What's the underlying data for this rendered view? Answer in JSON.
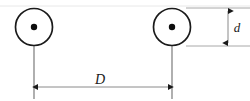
{
  "figure": {
    "type": "engineering-dimension-diagram",
    "canvas": {
      "width": 250,
      "height": 101,
      "background": "#ffffff"
    },
    "colors": {
      "stroke": "#1a1a1a",
      "dimension_line": "#808080",
      "extension_line": "#9a9a9a",
      "faint_rule": "#e2e2e2",
      "fill": "#ffffff"
    },
    "wheels": [
      {
        "name": "left-wheel",
        "cx": 34,
        "cy": 27,
        "r": 18.5,
        "hub_r": 3.2
      },
      {
        "name": "right-wheel",
        "cx": 172,
        "cy": 27,
        "r": 18.5,
        "hub_r": 3.2
      }
    ],
    "center_lines": [
      {
        "name": "left-center-line",
        "x": 34,
        "y1": 27,
        "y2": 99
      },
      {
        "name": "right-center-line",
        "x": 172,
        "y1": 27,
        "y2": 99
      }
    ],
    "dimensions": [
      {
        "name": "center-distance",
        "label": "D",
        "orientation": "horizontal",
        "y": 87,
        "x1": 34,
        "x2": 172,
        "label_x": 100,
        "label_y": 84
      },
      {
        "name": "wheel-diameter",
        "label": "d",
        "orientation": "vertical",
        "x": 228,
        "y1": 8,
        "y2": 46,
        "label_x": 236,
        "label_y": 31
      }
    ],
    "extension_lines": [
      {
        "name": "diameter-top-extension",
        "x1": 186,
        "y1": 8,
        "x2": 250,
        "y2": 8
      },
      {
        "name": "diameter-bottom-extension",
        "x1": 186,
        "y1": 46,
        "x2": 250,
        "y2": 46
      }
    ],
    "faint_rules": [
      {
        "name": "top-faint-rule",
        "x1": 0,
        "y1": 6,
        "x2": 250,
        "y2": 6
      }
    ]
  }
}
